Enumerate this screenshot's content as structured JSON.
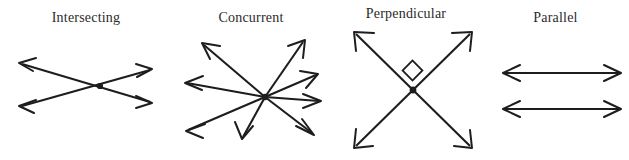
{
  "figure": {
    "background_color": "#ffffff",
    "ink_color": "#1d1d1d",
    "width": 629,
    "height": 160,
    "panels": [
      {
        "id": "intersecting",
        "label": "Intersecting",
        "description": "Two straight lines crossing at one point, each line drawn with arrowheads at both ends",
        "line_count": 2,
        "intersection_points": 1,
        "marker": "dot"
      },
      {
        "id": "concurrent",
        "label": "Concurrent",
        "description": "Several straight lines all passing through one common point, drawn as eight rays with arrowheads",
        "line_count": 4,
        "ray_count": 8,
        "intersection_points": 1,
        "marker": "dot"
      },
      {
        "id": "perpendicular",
        "label": "Perpendicular",
        "description": "Two lines crossing at a right angle, marked with a small square at the vertex",
        "line_count": 2,
        "intersection_points": 1,
        "angle_degrees": 90,
        "marker": "right-angle-square"
      },
      {
        "id": "parallel",
        "label": "Parallel",
        "description": "Two horizontal lines that never meet, each with arrowheads at both ends",
        "line_count": 2,
        "intersection_points": 0,
        "marker": "none"
      }
    ]
  }
}
